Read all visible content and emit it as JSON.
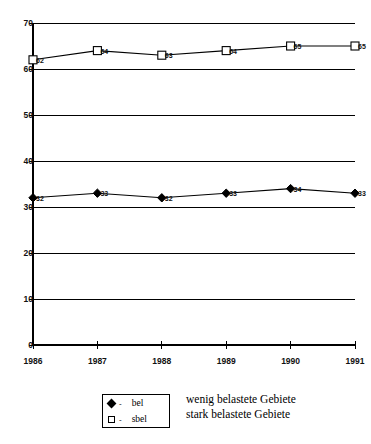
{
  "chart_data": {
    "type": "line",
    "title": "",
    "xlabel": "",
    "ylabel": "",
    "categories": [
      "1986",
      "1987",
      "1988",
      "1989",
      "1990",
      "1991"
    ],
    "ylim": [
      0,
      70
    ],
    "yticks": [
      0,
      10,
      20,
      30,
      40,
      50,
      60,
      70
    ],
    "ytick_labels": [
      "0",
      "10",
      "20",
      "30",
      "40",
      "50",
      "60",
      "70"
    ],
    "grid": true,
    "grid_orientation": "horizontal",
    "legend_position": "bottom",
    "series": [
      {
        "name": "sbel",
        "description": "stark belastete Gebiete",
        "marker": "open-square",
        "values": [
          62,
          64,
          63,
          64,
          65,
          65
        ],
        "labels": [
          "62",
          "64",
          "63",
          "64",
          "65",
          "65"
        ]
      },
      {
        "name": "bel",
        "description": "wenig belastete Gebiete",
        "marker": "filled-diamond",
        "values": [
          32,
          33,
          32,
          33,
          34,
          33
        ],
        "labels": [
          "32",
          "33",
          "32",
          "33",
          "34",
          "33"
        ]
      }
    ],
    "colors": {
      "line": "#000000",
      "grid": "#000000",
      "axis": "#000000",
      "text": "#111111",
      "background": "#ffffff"
    }
  },
  "legend": {
    "entries": [
      {
        "symbol": "filled-diamond",
        "dash": "-",
        "key": "bel",
        "description": "wenig belastete Gebiete"
      },
      {
        "symbol": "open-square",
        "dash": "-",
        "key": "sbel",
        "description": "stark belastete Gebiete"
      }
    ]
  }
}
